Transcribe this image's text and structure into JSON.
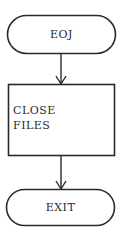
{
  "flowchart": {
    "nodes": [
      {
        "id": "eoj",
        "type": "terminator",
        "label": "EOJ"
      },
      {
        "id": "close-files",
        "type": "process",
        "label_line1": "CLOSE",
        "label_line2": "FILES"
      },
      {
        "id": "exit",
        "type": "terminator",
        "label": "EXIT"
      }
    ],
    "edges": [
      {
        "from": "eoj",
        "to": "close-files"
      },
      {
        "from": "close-files",
        "to": "exit"
      }
    ]
  },
  "colors": {
    "stroke": "#2a2a2a",
    "background": "#ffffff"
  }
}
